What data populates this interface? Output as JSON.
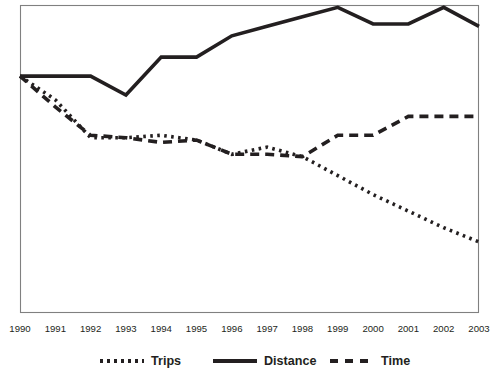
{
  "figure": {
    "width": 500,
    "height": 378,
    "background_color": "#ffffff",
    "ink_color": "#231f20",
    "frame_color": "#808080"
  },
  "plot_area": {
    "left": 20,
    "top": 5,
    "right": 479,
    "bottom": 313,
    "grid_visible": false,
    "y_axis_labels_visible": false,
    "y_axis_ticks_visible": false,
    "title_visible": false
  },
  "chart_data": {
    "type": "line",
    "title": "",
    "subtitle": "",
    "xlabel": "",
    "ylabel": "",
    "grid": false,
    "legend_position": "bottom",
    "x": [
      1990,
      1991,
      1992,
      1993,
      1994,
      1995,
      1996,
      1997,
      1998,
      1999,
      2000,
      2001,
      2002,
      2003
    ],
    "categories": [
      "1990",
      "1991",
      "1992",
      "1993",
      "1994",
      "1995",
      "1996",
      "1997",
      "1998",
      "1999",
      "2000",
      "2001",
      "2002",
      "2003"
    ],
    "xlim": [
      1990,
      2003
    ],
    "ylim": [
      0,
      130
    ],
    "series": [
      {
        "name": "Trips",
        "style": "dotted",
        "color": "#231f20",
        "values": [
          100,
          90,
          74,
          74,
          75,
          73,
          67,
          70,
          66,
          58,
          50,
          43,
          36,
          30
        ]
      },
      {
        "name": "Distance",
        "style": "solid",
        "color": "#231f20",
        "values": [
          100,
          100,
          100,
          92,
          108,
          108,
          117,
          121,
          125,
          129,
          122,
          122,
          129,
          121
        ]
      },
      {
        "name": "Time",
        "style": "dashed",
        "color": "#231f20",
        "values": [
          100,
          87,
          75,
          74,
          72,
          73,
          67,
          67,
          66,
          75,
          75,
          83,
          83,
          83
        ]
      }
    ]
  },
  "axis": {
    "x_tick_labels": [
      "1990",
      "1991",
      "1992",
      "1993",
      "1994",
      "1995",
      "1996",
      "1997",
      "1998",
      "1999",
      "2000",
      "2001",
      "2002",
      "2003"
    ]
  },
  "legend": {
    "entries": [
      {
        "label": "Trips",
        "style": "dotted"
      },
      {
        "label": "Distance",
        "style": "solid"
      },
      {
        "label": "Time",
        "style": "dashed"
      }
    ]
  }
}
